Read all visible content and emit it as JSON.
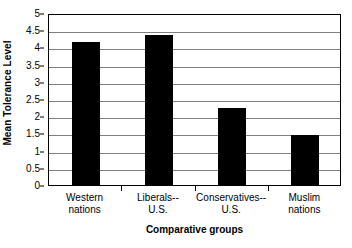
{
  "chart_data": {
    "type": "bar",
    "title": "",
    "xlabel": "Comparative groups",
    "ylabel": "Mean Tolerance Level",
    "categories": [
      "Western nations",
      "Liberals-- U.S.",
      "Conservatives-- U.S.",
      "Muslim nations"
    ],
    "category_lines": [
      [
        "Western",
        "nations"
      ],
      [
        "Liberals--",
        "U.S."
      ],
      [
        "Conservatives--",
        "U.S."
      ],
      [
        "Muslim",
        "nations"
      ]
    ],
    "values": [
      4.15,
      4.35,
      2.25,
      1.45
    ],
    "ylim": [
      0,
      5
    ],
    "ytick_values": [
      0,
      0.5,
      1,
      1.5,
      2,
      2.5,
      3,
      3.5,
      4,
      4.5,
      5
    ],
    "ytick_labels": [
      "0",
      "0.5",
      "1",
      "1.5",
      "2",
      "2.5",
      "3",
      "3.5",
      "4",
      "4.5",
      "5"
    ],
    "grid": true,
    "grid_axis": "y",
    "legend": "none",
    "bar_color": "#000000",
    "grid_color": "#808080",
    "axis_color": "#000000",
    "background_color": "#FFFFFF"
  }
}
